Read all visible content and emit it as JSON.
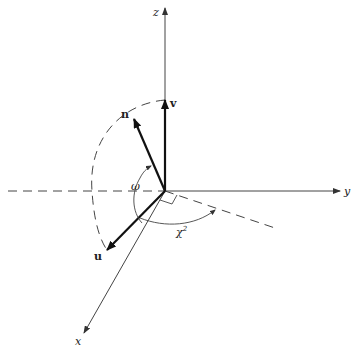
{
  "diagram": {
    "type": "3d-vector-diagram",
    "colors": {
      "line": "#333333",
      "background": "#ffffff"
    },
    "origin": [
      165,
      191
    ],
    "axes": [
      {
        "name": "z",
        "label": "z",
        "tip": [
          165,
          8
        ]
      },
      {
        "name": "y",
        "label": "y",
        "tip": [
          340,
          191
        ]
      },
      {
        "name": "x",
        "label": "x",
        "tip": [
          84,
          333
        ]
      }
    ],
    "vectors": [
      {
        "name": "v",
        "label": "v",
        "tip": [
          165,
          100
        ]
      },
      {
        "name": "n",
        "label": "n",
        "tip": [
          134,
          119
        ]
      },
      {
        "name": "u",
        "label": "u",
        "tip": [
          107,
          250
        ]
      }
    ],
    "angles": [
      {
        "name": "omega",
        "label": "ω"
      },
      {
        "name": "chi",
        "label": "χ",
        "superscript": "2"
      }
    ],
    "dashed": [
      "negative-y-axis",
      "unit-arc",
      "projection-line"
    ]
  }
}
